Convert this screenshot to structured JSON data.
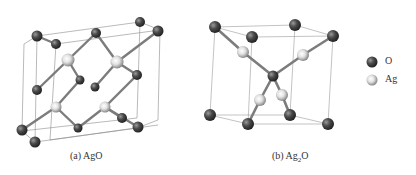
{
  "panels": [
    {
      "id": "a",
      "caption": "(a) AgO",
      "caption_pos": [
        70,
        152
      ]
    },
    {
      "id": "b",
      "caption_prefix": "(b) Ag",
      "caption_sub": "2",
      "caption_suffix": "O",
      "caption_pos": [
        272,
        152
      ]
    }
  ],
  "legend": {
    "items": [
      {
        "label": "O",
        "color": "#3a3a3a"
      },
      {
        "label": "Ag",
        "color": "#c8c8c8"
      }
    ]
  },
  "colors": {
    "oxygen": "#3a3a3a",
    "silver": "#c8c8c8",
    "bond": "#8a8a8a",
    "cell_edge": "#999999"
  }
}
